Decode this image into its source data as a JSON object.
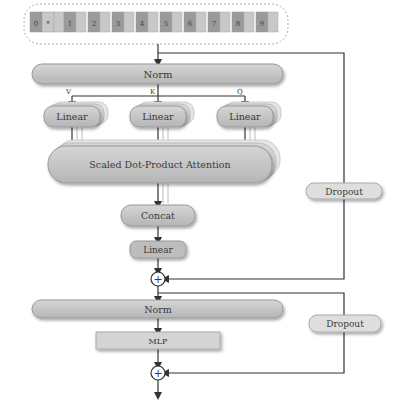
{
  "input": {
    "tokens": [
      "0",
      "*",
      "1",
      "2",
      "3",
      "4",
      "5",
      "6",
      "7",
      "8",
      "9"
    ]
  },
  "attention_block": {
    "norm_label": "Norm",
    "branch_labels": {
      "v": "V",
      "k": "K",
      "q": "Q"
    },
    "linear_label": "Linear",
    "sdpa_label": "Scaled Dot-Product Attention",
    "concat_label": "Concat",
    "output_linear_label": "Linear",
    "dropout_label": "Dropout",
    "add_symbol": "+"
  },
  "mlp_block": {
    "norm_label": "Norm",
    "mlp_label": "MLP",
    "dropout_label": "Dropout",
    "add_symbol": "+"
  },
  "colors": {
    "box_fill": "#c2c2c2",
    "box_fill_light": "#d9d9d9",
    "box_stroke": "#8a8a8a",
    "token_dark": "#9a9a9a",
    "token_light": "#c8c8c8",
    "line": "#333333"
  }
}
